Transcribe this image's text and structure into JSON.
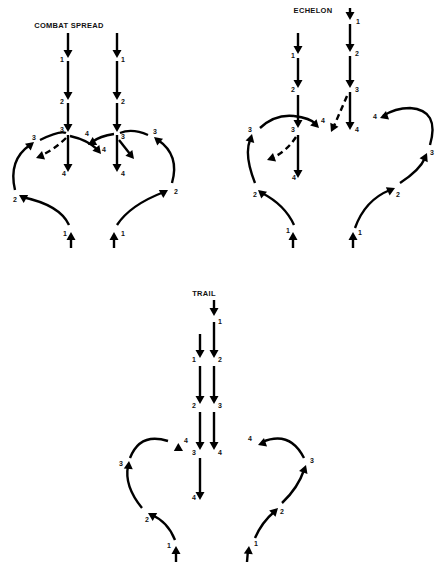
{
  "panels": [
    {
      "id": "combat-spread",
      "title": "COMBAT SPREAD",
      "title_pos": [
        69,
        28
      ],
      "paths": [
        {
          "kind": "solid",
          "d": "M68,33 L68,54",
          "head": [
            68,
            58,
            90
          ]
        },
        {
          "kind": "solid",
          "d": "M68,61 L68,96",
          "head": [
            68,
            100,
            90
          ]
        },
        {
          "kind": "solid",
          "d": "M68,103 L68,128",
          "head": [
            68,
            132,
            90
          ]
        },
        {
          "kind": "solid",
          "d": "M68,135 L68,168",
          "head": [
            68,
            172,
            90
          ]
        },
        {
          "kind": "solid",
          "d": "M70,136 Q88,140 98,150",
          "head": [
            101,
            154,
            50
          ]
        },
        {
          "kind": "dash",
          "d": "M66,138 Q54,150 40,156",
          "head": [
            36,
            158,
            160
          ]
        },
        {
          "kind": "solid",
          "d": "M117,33 L117,54",
          "head": [
            117,
            58,
            90
          ]
        },
        {
          "kind": "solid",
          "d": "M117,61 L117,96",
          "head": [
            117,
            100,
            90
          ]
        },
        {
          "kind": "solid",
          "d": "M117,103 L117,128",
          "head": [
            117,
            132,
            90
          ]
        },
        {
          "kind": "solid",
          "d": "M117,135 L117,168",
          "head": [
            117,
            172,
            90
          ]
        },
        {
          "kind": "solid",
          "d": "M114,134 Q100,136 92,142",
          "head": [
            88,
            145,
            150
          ]
        },
        {
          "kind": "solid",
          "d": "M119,140 L130,154",
          "head": [
            134,
            159,
            50
          ]
        },
        {
          "kind": "solid",
          "d": "M71,248 L71,236",
          "head": [
            71,
            232,
            -90
          ]
        },
        {
          "kind": "solid",
          "d": "M69,225 Q60,205 22,197",
          "head": [
            19,
            195,
            -150
          ]
        },
        {
          "kind": "solid",
          "d": "M15,190 Q8,160 30,145",
          "head": [
            34,
            142,
            -40
          ]
        },
        {
          "kind": "solid",
          "d": "M40,140 Q60,130 66,133",
          "head": null
        },
        {
          "kind": "solid",
          "d": "M114,248 L114,236",
          "head": [
            114,
            232,
            -90
          ]
        },
        {
          "kind": "solid",
          "d": "M117,225 Q130,205 164,192",
          "head": [
            168,
            190,
            -30
          ]
        },
        {
          "kind": "solid",
          "d": "M172,183 Q180,155 158,140",
          "head": [
            154,
            137,
            -140
          ]
        },
        {
          "kind": "solid",
          "d": "M148,135 Q132,128 120,133",
          "head": null
        }
      ],
      "labels": [
        {
          "t": "1",
          "x": 60,
          "y": 62
        },
        {
          "t": "2",
          "x": 60,
          "y": 104
        },
        {
          "t": "3",
          "x": 60,
          "y": 132
        },
        {
          "t": "4",
          "x": 62,
          "y": 176
        },
        {
          "t": "4",
          "x": 102,
          "y": 152
        },
        {
          "t": "3",
          "x": 32,
          "y": 140
        },
        {
          "t": "2",
          "x": 13,
          "y": 202
        },
        {
          "t": "1",
          "x": 63,
          "y": 236
        },
        {
          "t": "1",
          "x": 121,
          "y": 62
        },
        {
          "t": "2",
          "x": 121,
          "y": 104
        },
        {
          "t": "3",
          "x": 121,
          "y": 139
        },
        {
          "t": "4",
          "x": 121,
          "y": 176
        },
        {
          "t": "4",
          "x": 85,
          "y": 136
        },
        {
          "t": "3",
          "x": 153,
          "y": 134
        },
        {
          "t": "2",
          "x": 174,
          "y": 194
        },
        {
          "t": "1",
          "x": 121,
          "y": 236
        }
      ]
    },
    {
      "id": "echelon",
      "title": "ECHELON",
      "title_pos": [
        313,
        13
      ],
      "paths": [
        {
          "kind": "solid",
          "d": "M350,8 L350,16",
          "head": [
            350,
            20,
            90
          ]
        },
        {
          "kind": "solid",
          "d": "M350,24 L350,48",
          "head": [
            350,
            52,
            90
          ]
        },
        {
          "kind": "solid",
          "d": "M350,56 L350,84",
          "head": [
            350,
            88,
            90
          ]
        },
        {
          "kind": "solid",
          "d": "M350,92 L350,126",
          "head": [
            350,
            130,
            90
          ]
        },
        {
          "kind": "dash",
          "d": "M347,96 L334,126",
          "head": [
            331,
            132,
            115
          ]
        },
        {
          "kind": "solid",
          "d": "M298,33 L298,50",
          "head": [
            298,
            54,
            90
          ]
        },
        {
          "kind": "solid",
          "d": "M298,58 L298,84",
          "head": [
            298,
            88,
            90
          ]
        },
        {
          "kind": "solid",
          "d": "M298,95 L298,124",
          "head": [
            298,
            128,
            90
          ]
        },
        {
          "kind": "solid",
          "d": "M298,135 L298,174",
          "head": [
            298,
            178,
            90
          ]
        },
        {
          "kind": "dash",
          "d": "M296,137 Q286,152 272,158",
          "head": [
            267,
            160,
            160
          ]
        },
        {
          "kind": "solid",
          "d": "M294,116 Q310,118 316,124",
          "head": [
            319,
            128,
            45
          ]
        },
        {
          "kind": "solid",
          "d": "M294,116 Q275,114 260,128",
          "head": null
        },
        {
          "kind": "solid",
          "d": "M293,248 L293,236",
          "head": [
            293,
            232,
            -90
          ]
        },
        {
          "kind": "solid",
          "d": "M294,225 Q285,205 262,193",
          "head": [
            258,
            190,
            -140
          ]
        },
        {
          "kind": "solid",
          "d": "M255,183 Q244,155 250,140",
          "head": [
            252,
            134,
            -75
          ]
        },
        {
          "kind": "solid",
          "d": "M353,248 L353,236",
          "head": [
            353,
            232,
            -90
          ]
        },
        {
          "kind": "solid",
          "d": "M355,228 Q365,200 390,190",
          "head": [
            395,
            188,
            -25
          ]
        },
        {
          "kind": "solid",
          "d": "M400,183 Q420,170 425,158",
          "head": [
            427,
            153,
            -65
          ]
        },
        {
          "kind": "solid",
          "d": "M430,145 Q440,110 410,108 Q395,108 383,116",
          "head": [
            380,
            118,
            160
          ]
        }
      ],
      "labels": [
        {
          "t": "1",
          "x": 356,
          "y": 24
        },
        {
          "t": "2",
          "x": 355,
          "y": 56
        },
        {
          "t": "3",
          "x": 355,
          "y": 92
        },
        {
          "t": "4",
          "x": 355,
          "y": 132
        },
        {
          "t": "1",
          "x": 291,
          "y": 58
        },
        {
          "t": "2",
          "x": 291,
          "y": 92
        },
        {
          "t": "3",
          "x": 291,
          "y": 132
        },
        {
          "t": "4",
          "x": 292,
          "y": 180
        },
        {
          "t": "4",
          "x": 321,
          "y": 123
        },
        {
          "t": "3",
          "x": 248,
          "y": 132
        },
        {
          "t": "2",
          "x": 253,
          "y": 197
        },
        {
          "t": "1",
          "x": 286,
          "y": 233
        },
        {
          "t": "1",
          "x": 358,
          "y": 235
        },
        {
          "t": "2",
          "x": 396,
          "y": 197
        },
        {
          "t": "3",
          "x": 430,
          "y": 155
        },
        {
          "t": "4",
          "x": 373,
          "y": 119
        }
      ]
    },
    {
      "id": "trail",
      "title": "TRAIL",
      "title_pos": [
        204,
        296
      ],
      "paths": [
        {
          "kind": "solid",
          "d": "M214,300 L214,312",
          "head": [
            214,
            316,
            90
          ]
        },
        {
          "kind": "solid",
          "d": "M214,322 L214,354",
          "head": [
            214,
            358,
            90
          ]
        },
        {
          "kind": "solid",
          "d": "M214,366 L214,400",
          "head": [
            214,
            404,
            90
          ]
        },
        {
          "kind": "solid",
          "d": "M214,412 L214,446",
          "head": [
            214,
            450,
            90
          ]
        },
        {
          "kind": "solid",
          "d": "M200,334 L200,354",
          "head": [
            200,
            358,
            90
          ]
        },
        {
          "kind": "solid",
          "d": "M200,366 L200,400",
          "head": [
            200,
            404,
            90
          ]
        },
        {
          "kind": "solid",
          "d": "M200,412 L200,446",
          "head": [
            200,
            450,
            90
          ]
        },
        {
          "kind": "solid",
          "d": "M200,458 L200,496",
          "head": [
            200,
            500,
            90
          ]
        },
        {
          "kind": "solid",
          "d": "M176,562 L176,550",
          "head": [
            176,
            546,
            -90
          ]
        },
        {
          "kind": "solid",
          "d": "M175,540 Q168,522 152,515",
          "head": [
            148,
            513,
            -150
          ]
        },
        {
          "kind": "solid",
          "d": "M142,508 Q124,486 128,466",
          "head": [
            129,
            461,
            -85
          ]
        },
        {
          "kind": "solid",
          "d": "M130,458 Q140,432 168,441",
          "head": [
            183,
            451,
            30
          ]
        },
        {
          "kind": "solid",
          "d": "M247,562 L248,550",
          "head": [
            249,
            546,
            -85
          ]
        },
        {
          "kind": "solid",
          "d": "M255,538 Q262,522 274,512",
          "head": [
            278,
            508,
            -45
          ]
        },
        {
          "kind": "solid",
          "d": "M282,503 Q298,488 304,470",
          "head": [
            306,
            465,
            -70
          ]
        },
        {
          "kind": "solid",
          "d": "M304,458 Q290,430 262,442",
          "head": [
            258,
            445,
            160
          ]
        }
      ],
      "labels": [
        {
          "t": "1",
          "x": 218,
          "y": 324
        },
        {
          "t": "1",
          "x": 192,
          "y": 362
        },
        {
          "t": "2",
          "x": 218,
          "y": 362
        },
        {
          "t": "2",
          "x": 192,
          "y": 408
        },
        {
          "t": "3",
          "x": 218,
          "y": 408
        },
        {
          "t": "3",
          "x": 192,
          "y": 455
        },
        {
          "t": "4",
          "x": 218,
          "y": 455
        },
        {
          "t": "4",
          "x": 192,
          "y": 500
        },
        {
          "t": "4",
          "x": 184,
          "y": 443
        },
        {
          "t": "3",
          "x": 119,
          "y": 466
        },
        {
          "t": "2",
          "x": 145,
          "y": 522
        },
        {
          "t": "1",
          "x": 167,
          "y": 548
        },
        {
          "t": "1",
          "x": 254,
          "y": 546
        },
        {
          "t": "2",
          "x": 280,
          "y": 514
        },
        {
          "t": "3",
          "x": 310,
          "y": 463
        },
        {
          "t": "4",
          "x": 248,
          "y": 441
        }
      ]
    }
  ],
  "colors": {
    "ink": "#000000",
    "background": "#ffffff"
  }
}
